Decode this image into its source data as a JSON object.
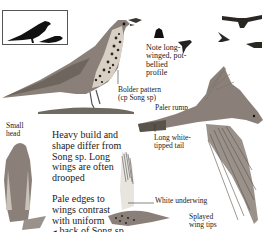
{
  "page": {
    "type": "field-guide-illustration",
    "subject_compared": "Song sp"
  },
  "inset": {
    "label": "silhouette-comparison",
    "icons": [
      "large-perched-bird-silhouette",
      "small-perched-bird-silhouette"
    ]
  },
  "annotations": {
    "bolder_pattern": "Bolder pattern",
    "bolder_pattern_sub": "(cp Song sp)",
    "note_profile_1": "Note long-",
    "note_profile_2": "winged, pot-",
    "note_profile_3": "bellied",
    "note_profile_4": "profile",
    "paler_rump": "Paler rump",
    "small_head_1": "Small",
    "small_head_2": "head",
    "long_tail_1": "Long white-",
    "long_tail_2": "tipped tail",
    "heavy_build_1": "Heavy build and",
    "heavy_build_2": "shape differ from",
    "heavy_build_3": "Song sp. Long",
    "heavy_build_4": "wings are often",
    "heavy_build_5": "drooped",
    "pale_edges_1": "Pale edges to",
    "pale_edges_2": "wings contrast",
    "pale_edges_3": "with uniform",
    "pale_edges_4": "back of Song sp",
    "pale_edges_pointer": "◀",
    "white_underwing": "White underwing",
    "splayed_1": "Splayed",
    "splayed_2": "wing tips"
  },
  "colors": {
    "bird_dark": "#3a3530",
    "bird_mid": "#8a8079",
    "bird_light": "#c9c2b8",
    "spots": "#2a2622",
    "ground": "#6f6a60",
    "text": "#222222"
  }
}
